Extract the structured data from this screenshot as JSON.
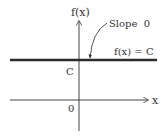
{
  "diagram": {
    "axes": {
      "y_label": "f(x)",
      "x_label": "x",
      "origin_label": "0"
    },
    "line": {
      "label": "f(x) = C",
      "intercept_label": "C",
      "color": "#2b2b2b"
    },
    "annotation": {
      "text": "Slope  0"
    },
    "colors": {
      "axis": "#444444",
      "text": "#333333",
      "background": "#ffffff"
    }
  }
}
